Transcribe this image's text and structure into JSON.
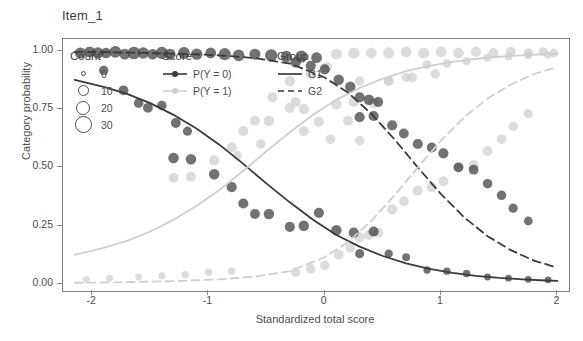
{
  "chart_data": {
    "type": "scatter",
    "title": "Item_1",
    "xlabel": "Standardized total score",
    "ylabel": "Category probability",
    "xlim": [
      -2.25,
      2.1
    ],
    "ylim": [
      -0.03,
      1.05
    ],
    "xticks": [
      "-2",
      "-1",
      "0",
      "1",
      "2"
    ],
    "xtick_values": [
      -2,
      -1,
      0,
      1,
      2
    ],
    "yticks": [
      "0.00",
      "0.25",
      "0.50",
      "0.75",
      "1.00"
    ],
    "ytick_values": [
      0.0,
      0.25,
      0.5,
      0.75,
      1.0
    ],
    "grid": false,
    "legend_position": "top-left inside panel",
    "legends": [
      {
        "title": "Count",
        "type": "size",
        "entries": [
          {
            "label": "0",
            "size": 3
          },
          {
            "label": "10",
            "size": 9
          },
          {
            "label": "20",
            "size": 12
          },
          {
            "label": "30",
            "size": 15
          }
        ]
      },
      {
        "title": "Score",
        "type": "color",
        "entries": [
          {
            "label": "P(Y = 0)",
            "color": "#3b3b3b"
          },
          {
            "label": "P(Y = 1)",
            "color": "#cfcfcf"
          }
        ]
      },
      {
        "title": "Group",
        "type": "linetype",
        "entries": [
          {
            "label": "G1",
            "linetype": "solid"
          },
          {
            "label": "G2",
            "linetype": "dashed"
          }
        ]
      }
    ],
    "series": [
      {
        "name": "G1 P(Y = 0)",
        "score": "P(Y = 0)",
        "group": "G1",
        "color": "#3b3b3b",
        "linetype": "solid",
        "curve_x": [
          -2.15,
          -1.9,
          -1.7,
          -1.5,
          -1.3,
          -1.1,
          -0.9,
          -0.7,
          -0.5,
          -0.3,
          -0.1,
          0.1,
          0.3,
          0.5,
          0.7,
          0.9,
          1.1,
          1.3,
          1.5,
          1.7,
          1.9,
          2.0
        ],
        "curve_y": [
          0.875,
          0.845,
          0.815,
          0.775,
          0.725,
          0.665,
          0.595,
          0.515,
          0.43,
          0.35,
          0.275,
          0.21,
          0.16,
          0.12,
          0.088,
          0.065,
          0.048,
          0.035,
          0.026,
          0.02,
          0.015,
          0.013
        ],
        "points": [
          {
            "x": -2.1,
            "y": 0.99,
            "n": 14
          },
          {
            "x": -2.02,
            "y": 0.995,
            "n": 13
          },
          {
            "x": -1.95,
            "y": 0.99,
            "n": 16
          },
          {
            "x": -1.88,
            "y": 0.99,
            "n": 12
          },
          {
            "x": -1.8,
            "y": 0.995,
            "n": 17
          },
          {
            "x": -1.72,
            "y": 0.985,
            "n": 13
          },
          {
            "x": -1.64,
            "y": 0.99,
            "n": 20
          },
          {
            "x": -1.56,
            "y": 0.99,
            "n": 15
          },
          {
            "x": -1.48,
            "y": 0.985,
            "n": 12
          },
          {
            "x": -1.4,
            "y": 0.99,
            "n": 19
          },
          {
            "x": -1.33,
            "y": 0.985,
            "n": 14
          },
          {
            "x": -1.21,
            "y": 0.99,
            "n": 17
          },
          {
            "x": -1.1,
            "y": 0.985,
            "n": 15
          },
          {
            "x": -0.98,
            "y": 0.99,
            "n": 13
          },
          {
            "x": -0.86,
            "y": 0.985,
            "n": 18
          },
          {
            "x": -0.74,
            "y": 0.98,
            "n": 16
          },
          {
            "x": -0.6,
            "y": 0.985,
            "n": 14
          },
          {
            "x": -0.46,
            "y": 0.98,
            "n": 19
          },
          {
            "x": -0.33,
            "y": 0.975,
            "n": 15
          },
          {
            "x": -0.2,
            "y": 0.975,
            "n": 17
          },
          {
            "x": -0.07,
            "y": 0.97,
            "n": 13
          },
          {
            "x": -1.9,
            "y": 0.915,
            "n": 9
          },
          {
            "x": -1.73,
            "y": 0.83,
            "n": 10
          },
          {
            "x": -1.6,
            "y": 0.775,
            "n": 9
          },
          {
            "x": -1.52,
            "y": 0.755,
            "n": 10
          },
          {
            "x": -1.4,
            "y": 0.765,
            "n": 9
          },
          {
            "x": -1.28,
            "y": 0.69,
            "n": 10
          },
          {
            "x": -1.18,
            "y": 0.655,
            "n": 8
          },
          {
            "x": -1.3,
            "y": 0.54,
            "n": 12
          },
          {
            "x": -1.15,
            "y": 0.535,
            "n": 12
          },
          {
            "x": -0.95,
            "y": 0.47,
            "n": 12
          },
          {
            "x": -0.8,
            "y": 0.415,
            "n": 11
          },
          {
            "x": -0.7,
            "y": 0.345,
            "n": 11
          },
          {
            "x": -0.6,
            "y": 0.3,
            "n": 10
          },
          {
            "x": -0.48,
            "y": 0.3,
            "n": 12
          },
          {
            "x": -0.3,
            "y": 0.245,
            "n": 11
          },
          {
            "x": -0.18,
            "y": 0.25,
            "n": 12
          },
          {
            "x": -0.05,
            "y": 0.305,
            "n": 11
          },
          {
            "x": 0.1,
            "y": 0.23,
            "n": 12
          },
          {
            "x": 0.25,
            "y": 0.22,
            "n": 11
          },
          {
            "x": 0.42,
            "y": 0.225,
            "n": 11
          },
          {
            "x": 0.3,
            "y": 0.13,
            "n": 8
          },
          {
            "x": 0.55,
            "y": 0.13,
            "n": 6
          },
          {
            "x": 0.7,
            "y": 0.115,
            "n": 5
          },
          {
            "x": 0.88,
            "y": 0.06,
            "n": 4
          },
          {
            "x": 1.05,
            "y": 0.055,
            "n": 4
          },
          {
            "x": 1.22,
            "y": 0.045,
            "n": 4
          },
          {
            "x": 1.4,
            "y": 0.03,
            "n": 3
          },
          {
            "x": 1.58,
            "y": 0.025,
            "n": 3
          },
          {
            "x": 1.75,
            "y": 0.02,
            "n": 3
          },
          {
            "x": 1.92,
            "y": 0.018,
            "n": 3
          }
        ]
      },
      {
        "name": "G1 P(Y = 1)",
        "score": "P(Y = 1)",
        "group": "G1",
        "color": "#cfcfcf",
        "linetype": "solid",
        "curve_x": [
          -2.15,
          -1.9,
          -1.7,
          -1.5,
          -1.3,
          -1.1,
          -0.9,
          -0.7,
          -0.5,
          -0.3,
          -0.1,
          0.1,
          0.3,
          0.5,
          0.7,
          0.9,
          1.1,
          1.3,
          1.5,
          1.7,
          1.9,
          2.0
        ],
        "curve_y": [
          0.125,
          0.155,
          0.185,
          0.225,
          0.275,
          0.335,
          0.405,
          0.485,
          0.57,
          0.65,
          0.725,
          0.79,
          0.84,
          0.88,
          0.912,
          0.935,
          0.952,
          0.965,
          0.974,
          0.98,
          0.985,
          0.987
        ],
        "points": [
          {
            "x": -1.3,
            "y": 0.455,
            "n": 10
          },
          {
            "x": -1.15,
            "y": 0.46,
            "n": 10
          },
          {
            "x": -0.95,
            "y": 0.53,
            "n": 11
          },
          {
            "x": -0.8,
            "y": 0.585,
            "n": 11
          },
          {
            "x": -0.7,
            "y": 0.655,
            "n": 11
          },
          {
            "x": -0.6,
            "y": 0.7,
            "n": 10
          },
          {
            "x": -0.48,
            "y": 0.7,
            "n": 12
          },
          {
            "x": -0.3,
            "y": 0.755,
            "n": 11
          },
          {
            "x": -0.18,
            "y": 0.75,
            "n": 12
          },
          {
            "x": -0.05,
            "y": 0.695,
            "n": 11
          },
          {
            "x": 0.1,
            "y": 0.77,
            "n": 12
          },
          {
            "x": 0.25,
            "y": 0.78,
            "n": 11
          },
          {
            "x": 0.42,
            "y": 0.775,
            "n": 11
          },
          {
            "x": 0.3,
            "y": 0.87,
            "n": 9
          },
          {
            "x": 0.55,
            "y": 0.87,
            "n": 8
          },
          {
            "x": 0.7,
            "y": 0.885,
            "n": 7
          },
          {
            "x": 0.88,
            "y": 0.94,
            "n": 7
          },
          {
            "x": 1.05,
            "y": 0.945,
            "n": 7
          },
          {
            "x": 1.22,
            "y": 0.955,
            "n": 6
          },
          {
            "x": 1.4,
            "y": 0.97,
            "n": 6
          },
          {
            "x": 1.58,
            "y": 0.975,
            "n": 5
          },
          {
            "x": 1.75,
            "y": 0.98,
            "n": 5
          },
          {
            "x": 1.92,
            "y": 0.982,
            "n": 4
          },
          {
            "x": -2.05,
            "y": 0.02,
            "n": 3
          },
          {
            "x": -1.85,
            "y": 0.025,
            "n": 3
          },
          {
            "x": -1.6,
            "y": 0.03,
            "n": 3
          },
          {
            "x": -1.4,
            "y": 0.035,
            "n": 4
          },
          {
            "x": -1.2,
            "y": 0.04,
            "n": 4
          },
          {
            "x": -1.0,
            "y": 0.05,
            "n": 4
          },
          {
            "x": -0.8,
            "y": 0.055,
            "n": 4
          },
          {
            "x": 0.3,
            "y": 0.615,
            "n": 9
          }
        ]
      },
      {
        "name": "G2 P(Y = 0)",
        "score": "P(Y = 0)",
        "group": "G2",
        "color": "#3b3b3b",
        "linetype": "dashed",
        "curve_x": [
          -2.15,
          -1.8,
          -1.5,
          -1.2,
          -0.9,
          -0.6,
          -0.3,
          0.0,
          0.2,
          0.4,
          0.6,
          0.8,
          1.0,
          1.2,
          1.4,
          1.6,
          1.8,
          2.0
        ],
        "curve_y": [
          0.995,
          0.993,
          0.99,
          0.986,
          0.98,
          0.968,
          0.945,
          0.885,
          0.82,
          0.73,
          0.62,
          0.5,
          0.385,
          0.285,
          0.205,
          0.145,
          0.1,
          0.07
        ],
        "points": [
          {
            "x": 0.12,
            "y": 0.875,
            "n": 12
          },
          {
            "x": 0.22,
            "y": 0.845,
            "n": 12
          },
          {
            "x": 0.3,
            "y": 0.8,
            "n": 11
          },
          {
            "x": 0.38,
            "y": 0.79,
            "n": 12
          },
          {
            "x": 0.46,
            "y": 0.78,
            "n": 10
          },
          {
            "x": 0.3,
            "y": 0.715,
            "n": 11
          },
          {
            "x": 0.42,
            "y": 0.72,
            "n": 11
          },
          {
            "x": 0.58,
            "y": 0.68,
            "n": 11
          },
          {
            "x": 0.68,
            "y": 0.645,
            "n": 10
          },
          {
            "x": 0.8,
            "y": 0.6,
            "n": 11
          },
          {
            "x": 0.92,
            "y": 0.585,
            "n": 10
          },
          {
            "x": 1.02,
            "y": 0.56,
            "n": 11
          },
          {
            "x": 1.15,
            "y": 0.5,
            "n": 10
          },
          {
            "x": 1.28,
            "y": 0.49,
            "n": 10
          },
          {
            "x": 1.4,
            "y": 0.43,
            "n": 9
          },
          {
            "x": 1.52,
            "y": 0.38,
            "n": 9
          },
          {
            "x": 1.62,
            "y": 0.325,
            "n": 8
          },
          {
            "x": 1.75,
            "y": 0.27,
            "n": 7
          },
          {
            "x": 0.0,
            "y": 0.92,
            "n": 11
          },
          {
            "x": -0.12,
            "y": 0.935,
            "n": 11
          },
          {
            "x": -0.25,
            "y": 0.95,
            "n": 12
          }
        ]
      },
      {
        "name": "G2 P(Y = 1)",
        "score": "P(Y = 1)",
        "group": "G2",
        "color": "#cfcfcf",
        "linetype": "dashed",
        "curve_x": [
          -2.15,
          -1.8,
          -1.5,
          -1.2,
          -0.9,
          -0.6,
          -0.3,
          0.0,
          0.2,
          0.4,
          0.6,
          0.8,
          1.0,
          1.2,
          1.4,
          1.6,
          1.8,
          2.0
        ],
        "curve_y": [
          0.005,
          0.007,
          0.01,
          0.014,
          0.02,
          0.032,
          0.055,
          0.115,
          0.18,
          0.27,
          0.38,
          0.5,
          0.615,
          0.715,
          0.795,
          0.855,
          0.9,
          0.93
        ],
        "points": [
          {
            "x": 0.12,
            "y": 0.125,
            "n": 10
          },
          {
            "x": 0.22,
            "y": 0.155,
            "n": 10
          },
          {
            "x": 0.3,
            "y": 0.2,
            "n": 11
          },
          {
            "x": 0.38,
            "y": 0.21,
            "n": 11
          },
          {
            "x": 0.46,
            "y": 0.22,
            "n": 10
          },
          {
            "x": 0.58,
            "y": 0.32,
            "n": 11
          },
          {
            "x": 0.68,
            "y": 0.355,
            "n": 10
          },
          {
            "x": 0.8,
            "y": 0.4,
            "n": 11
          },
          {
            "x": 0.92,
            "y": 0.415,
            "n": 10
          },
          {
            "x": 1.02,
            "y": 0.44,
            "n": 11
          },
          {
            "x": 1.15,
            "y": 0.5,
            "n": 10
          },
          {
            "x": 1.28,
            "y": 0.51,
            "n": 10
          },
          {
            "x": 1.4,
            "y": 0.57,
            "n": 10
          },
          {
            "x": 1.52,
            "y": 0.62,
            "n": 10
          },
          {
            "x": 1.62,
            "y": 0.675,
            "n": 9
          },
          {
            "x": 1.75,
            "y": 0.73,
            "n": 8
          },
          {
            "x": 0.0,
            "y": 0.08,
            "n": 9
          },
          {
            "x": -0.12,
            "y": 0.065,
            "n": 9
          },
          {
            "x": -0.25,
            "y": 0.05,
            "n": 9
          },
          {
            "x": 0.1,
            "y": 0.985,
            "n": 13
          },
          {
            "x": 0.25,
            "y": 0.99,
            "n": 14
          },
          {
            "x": 0.4,
            "y": 0.99,
            "n": 13
          },
          {
            "x": 0.55,
            "y": 0.99,
            "n": 15
          },
          {
            "x": 0.7,
            "y": 0.995,
            "n": 13
          },
          {
            "x": 0.85,
            "y": 0.99,
            "n": 14
          },
          {
            "x": 1.0,
            "y": 0.995,
            "n": 12
          },
          {
            "x": 1.15,
            "y": 0.99,
            "n": 13
          },
          {
            "x": 1.3,
            "y": 0.995,
            "n": 11
          },
          {
            "x": 1.45,
            "y": 0.99,
            "n": 11
          },
          {
            "x": 1.6,
            "y": 0.995,
            "n": 10
          },
          {
            "x": 1.75,
            "y": 0.99,
            "n": 9
          },
          {
            "x": 1.88,
            "y": 0.995,
            "n": 8
          },
          {
            "x": 1.97,
            "y": 0.99,
            "n": 7
          },
          {
            "x": -0.3,
            "y": 0.87,
            "n": 12
          },
          {
            "x": -0.12,
            "y": 0.9,
            "n": 13
          },
          {
            "x": 0.02,
            "y": 0.93,
            "n": 12
          },
          {
            "x": 0.55,
            "y": 0.87,
            "n": 11
          },
          {
            "x": 0.75,
            "y": 0.885,
            "n": 10
          },
          {
            "x": 0.95,
            "y": 0.9,
            "n": 9
          },
          {
            "x": -0.45,
            "y": 0.8,
            "n": 11
          },
          {
            "x": -0.25,
            "y": 0.78,
            "n": 10
          },
          {
            "x": 0.2,
            "y": 0.7,
            "n": 10
          },
          {
            "x": 0.05,
            "y": 0.62,
            "n": 10
          },
          {
            "x": -0.18,
            "y": 0.655,
            "n": 10
          },
          {
            "x": -0.55,
            "y": 0.6,
            "n": 9
          },
          {
            "x": -0.75,
            "y": 0.55,
            "n": 8
          }
        ]
      }
    ]
  }
}
